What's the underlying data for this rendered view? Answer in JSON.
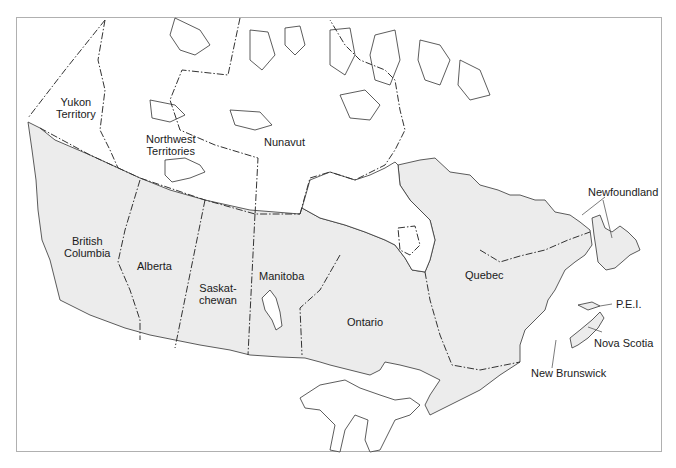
{
  "map": {
    "title": "Provinces and Territories of Canada",
    "colors": {
      "province_fill": "#ececec",
      "territory_fill": "#ffffff",
      "outline": "#333333",
      "frame": "#b0b0b0"
    },
    "regions": [
      {
        "name": "Yukon Territory",
        "line1": "Yukon",
        "line2": "Territory",
        "type": "territory"
      },
      {
        "name": "Northwest Territories",
        "line1": "Northwest",
        "line2": "Territories",
        "type": "territory"
      },
      {
        "name": "Nunavut",
        "line1": "Nunavut",
        "type": "territory"
      },
      {
        "name": "British Columbia",
        "line1": "British",
        "line2": "Columbia",
        "type": "province"
      },
      {
        "name": "Alberta",
        "line1": "Alberta",
        "type": "province"
      },
      {
        "name": "Saskatchewan",
        "line1": "Saskat-",
        "line2": "chewan",
        "type": "province"
      },
      {
        "name": "Manitoba",
        "line1": "Manitoba",
        "type": "province"
      },
      {
        "name": "Ontario",
        "line1": "Ontario",
        "type": "province"
      },
      {
        "name": "Quebec",
        "line1": "Quebec",
        "type": "province"
      },
      {
        "name": "Newfoundland",
        "line1": "Newfoundland",
        "type": "province"
      },
      {
        "name": "P.E.I.",
        "line1": "P.E.I.",
        "type": "province"
      },
      {
        "name": "Nova Scotia",
        "line1": "Nova Scotia",
        "type": "province"
      },
      {
        "name": "New Brunswick",
        "line1": "New Brunswick",
        "type": "province"
      }
    ]
  }
}
